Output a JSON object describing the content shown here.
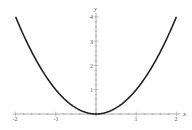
{
  "chart_data": {
    "type": "line",
    "title": "",
    "xlabel": "x",
    "ylabel": "y",
    "xlim": [
      -2,
      2
    ],
    "ylim": [
      0,
      4
    ],
    "grid": false,
    "legend": null,
    "function": "y = x^2",
    "x_ticks": [
      "-2",
      "-1",
      "1",
      "2"
    ],
    "y_ticks": [
      "1",
      "2",
      "3",
      "4"
    ],
    "series": [
      {
        "name": "x^2",
        "color": "#222222",
        "x": [
          -2,
          -1.5,
          -1,
          -0.5,
          0,
          0.5,
          1,
          1.5,
          2
        ],
        "values": [
          4,
          2.25,
          1,
          0.25,
          0,
          0.25,
          1,
          2.25,
          4
        ]
      }
    ]
  },
  "axes": {
    "x_label": "x",
    "y_label": "y",
    "x_tick_labels": [
      "-2",
      "-1",
      "1",
      "2"
    ],
    "y_tick_labels": [
      "1",
      "2",
      "3",
      "4"
    ]
  }
}
